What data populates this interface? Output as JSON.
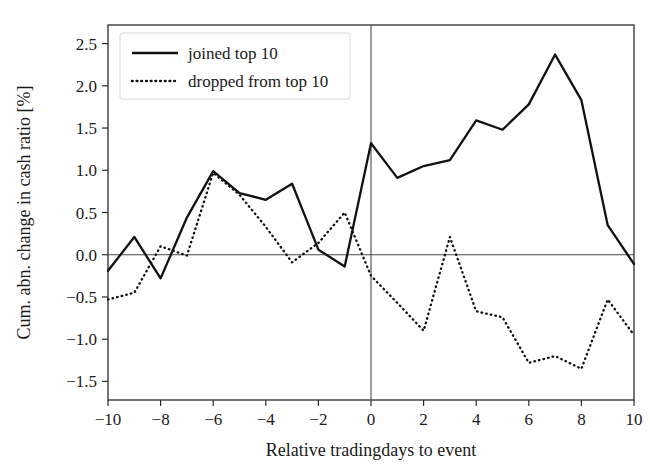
{
  "chart_data": {
    "type": "line",
    "title": "",
    "xlabel": "Relative tradingdays to event",
    "ylabel": "Cum. abn. change in cash ratio [%]",
    "xlim": [
      -10,
      10
    ],
    "ylim": [
      -1.72,
      2.72
    ],
    "xticks": [
      -10,
      -8,
      -6,
      -4,
      -2,
      0,
      2,
      4,
      6,
      8,
      10
    ],
    "xticklabels": [
      "−10",
      "−8",
      "−6",
      "−4",
      "−2",
      "0",
      "2",
      "4",
      "6",
      "8",
      "10"
    ],
    "yticks": [
      -1.5,
      -1.0,
      -0.5,
      0.0,
      0.5,
      1.0,
      1.5,
      2.0,
      2.5
    ],
    "yticklabels": [
      "−1.5",
      "−1.0",
      "−0.5",
      "0.0",
      "0.5",
      "1.0",
      "1.5",
      "2.0",
      "2.5"
    ],
    "grid": false,
    "legend_position": "upper left",
    "zero_hline": 0,
    "event_vline": 0,
    "x": [
      -10,
      -9,
      -8,
      -7,
      -6,
      -5,
      -4,
      -3,
      -2,
      -1,
      0,
      1,
      2,
      3,
      4,
      5,
      6,
      7,
      8,
      9,
      10
    ],
    "series": [
      {
        "name": "joined top 10",
        "style": "solid",
        "color": "#111111",
        "values": [
          -0.19,
          0.21,
          -0.28,
          0.44,
          0.99,
          0.73,
          0.65,
          0.84,
          0.06,
          -0.14,
          1.32,
          0.91,
          1.05,
          1.12,
          1.59,
          1.48,
          1.78,
          2.37,
          1.83,
          0.35,
          -0.11
        ]
      },
      {
        "name": "dropped from top 10",
        "style": "dotted",
        "color": "#111111",
        "values": [
          -0.53,
          -0.45,
          0.1,
          -0.01,
          0.97,
          0.71,
          0.33,
          -0.09,
          0.14,
          0.5,
          -0.25,
          -0.57,
          -0.9,
          0.21,
          -0.67,
          -0.74,
          -1.28,
          -1.2,
          -1.35,
          -0.53,
          -0.95
        ]
      }
    ]
  },
  "legend": {
    "entries": [
      {
        "label": "joined top 10"
      },
      {
        "label": "dropped from top 10"
      }
    ]
  }
}
